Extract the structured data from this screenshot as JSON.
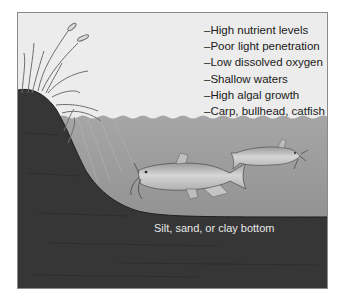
{
  "figure": {
    "type": "lake-habitat-illustration",
    "traits": [
      "–High nutrient levels",
      "–Poor light penetration",
      "–Low dissolved oxygen",
      "–Shallow waters",
      "–High algal growth",
      "–Carp, bullhead, catfish"
    ],
    "bottom_label": "Silt, sand, or clay bottom",
    "colors": {
      "sky": "#ececec",
      "water_top": "#a6a6a6",
      "water_bottom": "#858585",
      "ground": "#363636",
      "frame_border": "#8a8a8a",
      "reeds": "#7a7a7a",
      "fish_body": "#c8c8c8"
    }
  }
}
